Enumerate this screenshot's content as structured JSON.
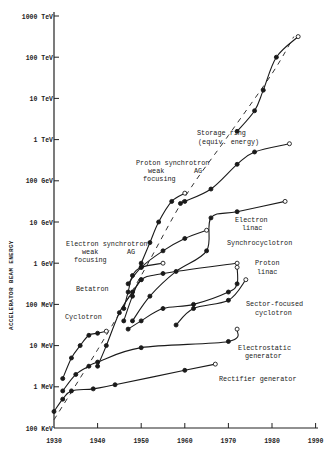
{
  "chart_data": {
    "type": "line",
    "title": "",
    "xlabel": "",
    "ylabel": "ACCELERATOR BEAM ENERGY",
    "xlim": [
      1930,
      1990
    ],
    "ylim_log10_eV": [
      5,
      15
    ],
    "y_scale": "log",
    "grid": false,
    "legend": "none (curves labeled inline)",
    "x_ticks": [
      "1930",
      "1940",
      "1950",
      "1960",
      "1970",
      "1980",
      "1990"
    ],
    "y_ticks": [
      "100 KeV",
      "1 MeV",
      "10 MeV",
      "100 MeV",
      "1 GeV",
      "10 GeV",
      "100 GeV",
      "1 TeV",
      "10 TeV",
      "100 TeV",
      "1000 TeV"
    ],
    "envelope": {
      "name": "Overall trend (dashed)",
      "points": [
        [
          1930,
          5.2
        ],
        [
          1940,
          6.9
        ],
        [
          1950,
          8.7
        ],
        [
          1960,
          10.6
        ],
        [
          1970,
          12.1
        ],
        [
          1980,
          13.6
        ],
        [
          1985,
          14.5
        ]
      ]
    },
    "series": [
      {
        "name": "Rectifier generator",
        "points": [
          [
            1930,
            5.4
          ],
          [
            1932,
            5.7
          ],
          [
            1934,
            5.9
          ],
          [
            1939,
            5.95
          ],
          [
            1944,
            6.05
          ],
          [
            1960,
            6.4
          ],
          [
            1967,
            6.55
          ]
        ]
      },
      {
        "name": "Electrostatic generator",
        "points": [
          [
            1932,
            5.9
          ],
          [
            1935,
            6.3
          ],
          [
            1938,
            6.5
          ],
          [
            1940,
            6.6
          ],
          [
            1950,
            6.95
          ],
          [
            1970,
            7.1
          ],
          [
            1972,
            7.4
          ]
        ]
      },
      {
        "name": "Cyclotron",
        "points": [
          [
            1932,
            6.2
          ],
          [
            1934,
            6.7
          ],
          [
            1936,
            7.0
          ],
          [
            1938,
            7.25
          ],
          [
            1940,
            7.3
          ],
          [
            1942,
            7.35
          ]
        ]
      },
      {
        "name": "Betatron",
        "points": [
          [
            1940,
            6.5
          ],
          [
            1942,
            7.0
          ],
          [
            1945,
            7.8
          ],
          [
            1948,
            8.3
          ],
          [
            1950,
            8.6
          ]
        ]
      },
      {
        "name": "Electron synchrotron weak focusing",
        "points": [
          [
            1946,
            7.9
          ],
          [
            1947,
            8.3
          ],
          [
            1948,
            8.7
          ],
          [
            1950,
            8.9
          ],
          [
            1955,
            9.0
          ]
        ]
      },
      {
        "name": "Electron synchrotron AG",
        "points": [
          [
            1947,
            8.5
          ],
          [
            1950,
            8.9
          ],
          [
            1955,
            9.3
          ],
          [
            1960,
            9.6
          ],
          [
            1965,
            9.8
          ]
        ]
      },
      {
        "name": "Synchrocyclotron",
        "points": [
          [
            1946,
            7.6
          ],
          [
            1948,
            8.2
          ],
          [
            1950,
            8.6
          ],
          [
            1955,
            8.75
          ],
          [
            1972,
            9.0
          ]
        ]
      },
      {
        "name": "Electron linac",
        "points": [
          [
            1948,
            7.6
          ],
          [
            1952,
            8.2
          ],
          [
            1958,
            8.8
          ],
          [
            1965,
            9.3
          ],
          [
            1966,
            10.1
          ],
          [
            1972,
            10.25
          ],
          [
            1983,
            10.5
          ]
        ]
      },
      {
        "name": "Proton linac",
        "points": [
          [
            1947,
            7.4
          ],
          [
            1950,
            7.6
          ],
          [
            1955,
            7.9
          ],
          [
            1962,
            8.0
          ],
          [
            1970,
            8.3
          ],
          [
            1972,
            8.5
          ],
          [
            1972,
            8.9
          ]
        ]
      },
      {
        "name": "Sector-focused cyclotron",
        "points": [
          [
            1958,
            7.5
          ],
          [
            1962,
            7.9
          ],
          [
            1970,
            8.1
          ],
          [
            1974,
            8.6
          ]
        ]
      },
      {
        "name": "Proton synchrotron weak focusing",
        "points": [
          [
            1950,
            9.0
          ],
          [
            1952,
            9.5
          ],
          [
            1954,
            10.0
          ],
          [
            1957,
            10.5
          ],
          [
            1960,
            10.7
          ]
        ]
      },
      {
        "name": "Proton synchrotron AG",
        "points": [
          [
            1959,
            10.45
          ],
          [
            1960,
            10.5
          ],
          [
            1966,
            10.8
          ],
          [
            1972,
            11.4
          ],
          [
            1976,
            11.7
          ],
          [
            1984,
            11.9
          ]
        ]
      },
      {
        "name": "Storage ring (equiv. energy)",
        "points": [
          [
            1972,
            12.2
          ],
          [
            1976,
            12.7
          ],
          [
            1978,
            13.2
          ],
          [
            1981,
            14.0
          ],
          [
            1986,
            14.5
          ]
        ]
      }
    ],
    "annotations": [
      {
        "text": "Storage ring",
        "x": 197,
        "y": 135
      },
      {
        "text": "(equiv. energy)",
        "x": 198,
        "y": 144
      },
      {
        "text": "Proton synchrotron",
        "x": 136,
        "y": 165
      },
      {
        "text": "weak",
        "x": 148,
        "y": 173
      },
      {
        "text": "focusing",
        "x": 143,
        "y": 181
      },
      {
        "text": "AG",
        "x": 194,
        "y": 173
      },
      {
        "text": "Electron",
        "x": 235,
        "y": 222
      },
      {
        "text": "linac",
        "x": 242,
        "y": 230
      },
      {
        "text": "Synchrocyclotron",
        "x": 227,
        "y": 245
      },
      {
        "text": "Electron synchrotron",
        "x": 66,
        "y": 246
      },
      {
        "text": "weak",
        "x": 82,
        "y": 254
      },
      {
        "text": "focusing",
        "x": 74,
        "y": 262
      },
      {
        "text": "AG",
        "x": 127,
        "y": 254
      },
      {
        "text": "Proton",
        "x": 255,
        "y": 265
      },
      {
        "text": "linac",
        "x": 257,
        "y": 274
      },
      {
        "text": "Betatron",
        "x": 76,
        "y": 291
      },
      {
        "text": "Sector-focused",
        "x": 246,
        "y": 306
      },
      {
        "text": "cyclotron",
        "x": 255,
        "y": 315
      },
      {
        "text": "Cyclotron",
        "x": 65,
        "y": 319
      },
      {
        "text": "Electrostatic",
        "x": 238,
        "y": 350
      },
      {
        "text": "generator",
        "x": 245,
        "y": 358
      },
      {
        "text": "Rectifier generator",
        "x": 219,
        "y": 381
      }
    ]
  }
}
